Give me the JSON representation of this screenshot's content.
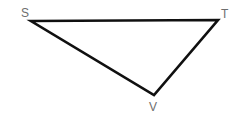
{
  "figure": {
    "type": "triangle-diagram",
    "background_color": "#ffffff",
    "stroke_color": "#101010",
    "stroke_width": 2.6,
    "label_color": "#6e6e6e",
    "label_font_size": 12,
    "canvas": {
      "width": 243,
      "height": 123
    },
    "vertices": [
      {
        "id": "S",
        "label": "S",
        "x": 31,
        "y": 21,
        "label_x": 21,
        "label_y": 7
      },
      {
        "id": "T",
        "label": "T",
        "x": 218,
        "y": 20,
        "label_x": 221,
        "label_y": 8
      },
      {
        "id": "V",
        "label": "V",
        "x": 154,
        "y": 95,
        "label_x": 149,
        "label_y": 101
      }
    ],
    "edges": [
      {
        "id": "ST",
        "from": "S",
        "to": "T"
      },
      {
        "id": "TV",
        "from": "T",
        "to": "V"
      },
      {
        "id": "VS",
        "from": "V",
        "to": "S"
      }
    ],
    "polygon_points": "31,21 218,20 154,95"
  }
}
